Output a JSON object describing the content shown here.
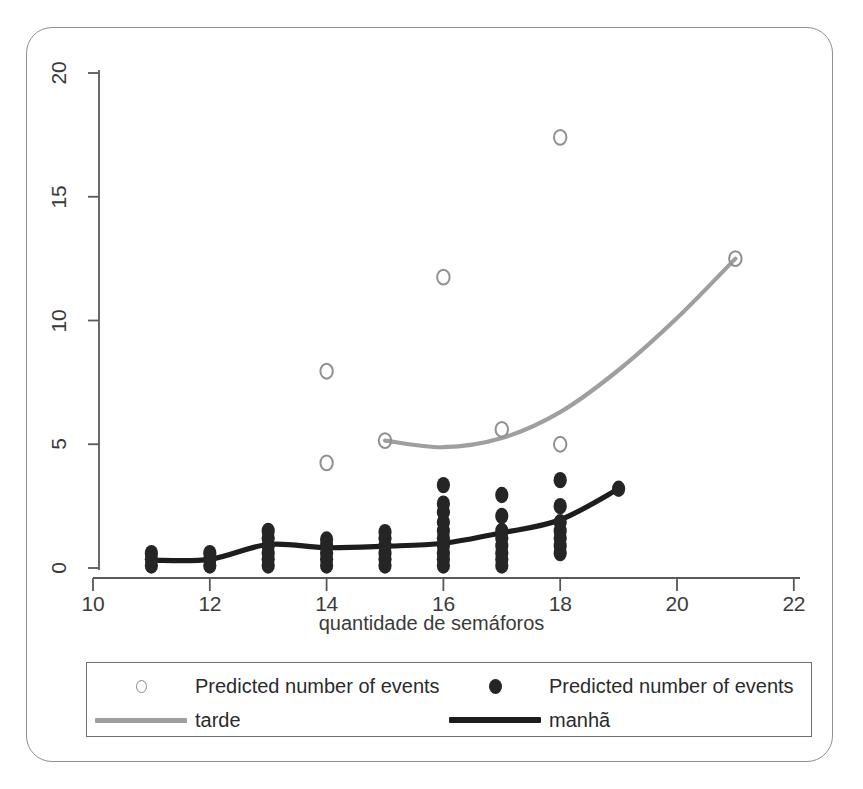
{
  "figure": {
    "background_color": "#ffffff",
    "frame_color": "#8d8f91"
  },
  "chart_data": {
    "type": "scatter",
    "title": "",
    "subtitle": "",
    "xlabel": "quantidade de semáforos",
    "ylabel": "",
    "xlim": [
      9.6,
      22.6
    ],
    "ylim": [
      -0.9,
      20.9
    ],
    "xticks": [
      10,
      12,
      14,
      16,
      18,
      20,
      22
    ],
    "xtick_labels": [
      "10",
      "12",
      "14",
      "16",
      "18",
      "20",
      "22"
    ],
    "yticks": [
      0,
      5,
      10,
      15,
      20
    ],
    "ytick_labels": [
      "0",
      "5",
      "10",
      "15",
      "20"
    ],
    "grid": false,
    "legend_position": "bottom",
    "legend_entries": [
      {
        "label": "Predicted number of events",
        "marker": "open-circle",
        "color": "#8e9092"
      },
      {
        "label": "Predicted number of events",
        "marker": "filled-dot",
        "color": "#252525"
      },
      {
        "label": "tarde",
        "marker": "line",
        "color": "#9d9fa1"
      },
      {
        "label": "manhã",
        "marker": "line",
        "color": "#1d1d1d"
      }
    ],
    "series": [
      {
        "name": "tarde",
        "kind": "scatter",
        "marker": "open-circle",
        "color": "#8e9092",
        "points": [
          {
            "x": 14,
            "y": 7.95
          },
          {
            "x": 14,
            "y": 4.25
          },
          {
            "x": 15,
            "y": 5.15
          },
          {
            "x": 16,
            "y": 11.75
          },
          {
            "x": 17,
            "y": 5.6
          },
          {
            "x": 18,
            "y": 17.4
          },
          {
            "x": 18,
            "y": 5.0
          },
          {
            "x": 21,
            "y": 12.5
          }
        ]
      },
      {
        "name": "tarde",
        "kind": "line",
        "color": "#9d9fa1",
        "x": [
          15,
          16,
          17,
          18,
          19,
          20,
          21
        ],
        "y": [
          5.15,
          4.88,
          5.25,
          6.3,
          8.0,
          10.1,
          12.5
        ]
      },
      {
        "name": "manhã",
        "kind": "scatter",
        "marker": "filled-dot",
        "color": "#252525",
        "points": [
          {
            "x": 11,
            "y": 0.1
          },
          {
            "x": 11,
            "y": 0.35
          },
          {
            "x": 11,
            "y": 0.6
          },
          {
            "x": 12,
            "y": 0.1
          },
          {
            "x": 12,
            "y": 0.35
          },
          {
            "x": 12,
            "y": 0.6
          },
          {
            "x": 13,
            "y": 0.1
          },
          {
            "x": 13,
            "y": 0.35
          },
          {
            "x": 13,
            "y": 0.6
          },
          {
            "x": 13,
            "y": 0.9
          },
          {
            "x": 13,
            "y": 1.2
          },
          {
            "x": 13,
            "y": 1.5
          },
          {
            "x": 14,
            "y": 0.1
          },
          {
            "x": 14,
            "y": 0.35
          },
          {
            "x": 14,
            "y": 0.6
          },
          {
            "x": 14,
            "y": 0.9
          },
          {
            "x": 14,
            "y": 1.15
          },
          {
            "x": 15,
            "y": 0.1
          },
          {
            "x": 15,
            "y": 0.35
          },
          {
            "x": 15,
            "y": 0.6
          },
          {
            "x": 15,
            "y": 0.9
          },
          {
            "x": 15,
            "y": 1.2
          },
          {
            "x": 15,
            "y": 1.45
          },
          {
            "x": 16,
            "y": 0.1
          },
          {
            "x": 16,
            "y": 0.35
          },
          {
            "x": 16,
            "y": 0.6
          },
          {
            "x": 16,
            "y": 0.9
          },
          {
            "x": 16,
            "y": 1.2
          },
          {
            "x": 16,
            "y": 1.5
          },
          {
            "x": 16,
            "y": 1.85
          },
          {
            "x": 16,
            "y": 2.25
          },
          {
            "x": 16,
            "y": 2.6
          },
          {
            "x": 16,
            "y": 3.35
          },
          {
            "x": 17,
            "y": 0.1
          },
          {
            "x": 17,
            "y": 0.35
          },
          {
            "x": 17,
            "y": 0.6
          },
          {
            "x": 17,
            "y": 0.9
          },
          {
            "x": 17,
            "y": 1.2
          },
          {
            "x": 17,
            "y": 1.5
          },
          {
            "x": 17,
            "y": 2.1
          },
          {
            "x": 17,
            "y": 2.95
          },
          {
            "x": 18,
            "y": 0.6
          },
          {
            "x": 18,
            "y": 0.9
          },
          {
            "x": 18,
            "y": 1.2
          },
          {
            "x": 18,
            "y": 1.5
          },
          {
            "x": 18,
            "y": 1.85
          },
          {
            "x": 18,
            "y": 2.5
          },
          {
            "x": 18,
            "y": 3.55
          },
          {
            "x": 19,
            "y": 3.2
          }
        ]
      },
      {
        "name": "manhã",
        "kind": "line",
        "color": "#1d1d1d",
        "x": [
          11,
          12,
          13,
          14,
          15,
          16,
          17,
          18,
          19
        ],
        "y": [
          0.32,
          0.35,
          0.95,
          0.82,
          0.88,
          1.0,
          1.42,
          1.95,
          3.2
        ]
      }
    ]
  },
  "axes": {
    "x_title": "quantidade de semáforos"
  }
}
